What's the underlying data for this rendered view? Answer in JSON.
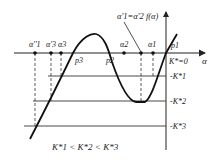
{
  "diagram": {
    "title_annotation": "α'1=α'2 f(α)",
    "axis_labels": {
      "horizontal": "α",
      "zero_line": "K*=0"
    },
    "level_labels": [
      "-K*1",
      "-K*2",
      "-K*3"
    ],
    "points_on_axis": [
      "α''1",
      "α'3",
      "α3",
      "α2",
      "α1"
    ],
    "intersections": [
      "p3",
      "p2",
      "p1"
    ],
    "condition": "K*1 < K*2 < K*3",
    "colors": {
      "stroke": "#222222",
      "background": "#ffffff"
    }
  }
}
